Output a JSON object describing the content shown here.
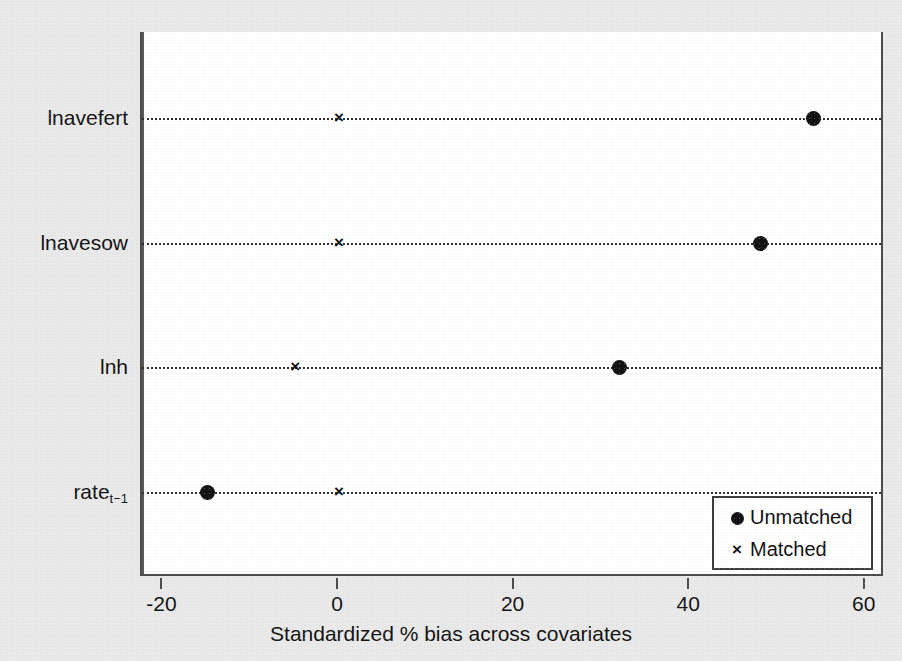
{
  "chart_data": {
    "type": "scatter",
    "title": "",
    "xlabel": "Standardized % bias across covariates",
    "ylabel": "",
    "xlim": [
      -26,
      64
    ],
    "xticks": [
      -20,
      0,
      20,
      40,
      60
    ],
    "xticklabels": [
      "-20",
      "0",
      "20",
      "40",
      "60"
    ],
    "categories": [
      "lnavefert",
      "lnavesow",
      "lnh",
      "rate"
    ],
    "category_labels": [
      "lnavefert",
      "lnavesow",
      "lnh",
      "rate"
    ],
    "category_subscripts": [
      "",
      "",
      "",
      "t−1"
    ],
    "grid": "horizontal-dotted",
    "legend_position": "lower right",
    "zero_reference_line": 0,
    "series": [
      {
        "name": "Unmatched",
        "marker": "filled-circle",
        "color": "#111111",
        "values": [
          54,
          48,
          32,
          -15
        ]
      },
      {
        "name": "Matched",
        "marker": "cross",
        "color": "#111111",
        "values": [
          0,
          0,
          -5,
          0
        ]
      }
    ]
  },
  "legend": {
    "items": [
      {
        "label": "Unmatched",
        "marker": "filled-circle"
      },
      {
        "label": "Matched",
        "marker": "cross"
      }
    ]
  },
  "colors": {
    "background": "#e9e9e9",
    "plot_background": "#ffffff",
    "axis": "#4c4c4c",
    "marker": "#111111",
    "gridline": "#2b2b2b"
  }
}
